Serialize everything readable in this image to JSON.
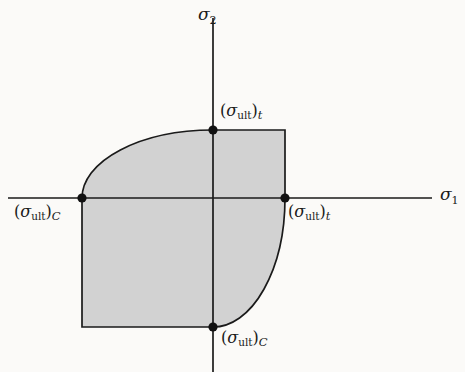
{
  "figure": {
    "background_color": "#fbfaf8",
    "line_color": "#1a1a1a",
    "fill_color": "#d2d2d2",
    "axes": {
      "horizontal": {
        "name": "sigma-1",
        "symbol": "σ",
        "subscript": "1",
        "x_start": 8,
        "x_end": 432,
        "y": 198
      },
      "vertical": {
        "name": "sigma-2",
        "symbol": "σ",
        "subscript": "2",
        "y_start": 18,
        "y_end": 372,
        "x": 213
      }
    },
    "origin": {
      "x": 213,
      "y": 198
    },
    "vertices": [
      {
        "name": "top-vertex",
        "x": 213,
        "y": 130,
        "symbol": "σ",
        "subscript": "ult",
        "qualifier": "t",
        "label_text": "(σult)t",
        "label_x": 220,
        "label_y": 103
      },
      {
        "name": "left-vertex",
        "x": 82,
        "y": 198,
        "symbol": "σ",
        "subscript": "ult",
        "qualifier": "C",
        "label_text": "(σult)C",
        "label_x": 14,
        "label_y": 204
      },
      {
        "name": "right-vertex",
        "x": 285,
        "y": 198,
        "symbol": "σ",
        "subscript": "ult",
        "qualifier": "t",
        "label_text": "(σult)t",
        "label_x": 288,
        "label_y": 204
      },
      {
        "name": "bottom-vertex",
        "x": 213,
        "y": 327,
        "symbol": "σ",
        "subscript": "ult",
        "qualifier": "C",
        "label_text": "(σult)C",
        "label_x": 221,
        "label_y": 330
      }
    ],
    "envelope": {
      "rect_left": 82,
      "rect_bottom": 327,
      "rect_right": 285,
      "rect_top": 130,
      "arc_upper_left": "elliptical arc from left vertex to top vertex",
      "arc_lower_right": "elliptical arc from right vertex to bottom vertex",
      "path": "M 82 198 A 131 68 0 0 1 213 130 L 285 130 L 285 198 A 72 129 0 0 1 213 327 L 82 327 Z"
    }
  },
  "labels": {
    "sigma1": {
      "symbol": "σ",
      "sub": "1"
    },
    "sigma2": {
      "symbol": "σ",
      "sub": "2"
    },
    "paren_open": "(",
    "paren_close": ")",
    "sigma": "σ",
    "ult": "ult",
    "tension": "t",
    "compression": "C"
  }
}
